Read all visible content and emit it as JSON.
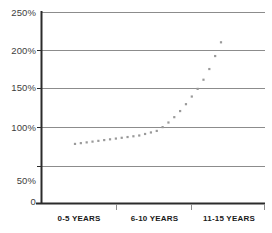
{
  "chart_data": {
    "type": "line",
    "title": "",
    "subtitle": "",
    "xlabel": "",
    "ylabel": "",
    "ylim": [
      0,
      250
    ],
    "ytick_labels": [
      "250%",
      "200%",
      "150%",
      "100%",
      "50%",
      "0"
    ],
    "ytick_values": [
      250,
      200,
      150,
      100,
      50,
      0
    ],
    "categories": [
      "0-5 YEARS",
      "6-10 YEARS",
      "11-15 YEARS"
    ],
    "grid": "horizontal",
    "legend": "none",
    "marker": "dotted-square",
    "series_color": "#9a9a9a",
    "axis_color": "#000000",
    "grid_color": "#808080",
    "series": [
      {
        "name": "",
        "x": [
          1,
          2,
          3,
          4,
          5,
          6,
          7,
          8,
          9,
          10,
          11,
          12,
          13,
          14,
          15,
          16,
          17,
          18,
          19,
          20,
          21,
          22,
          23,
          24,
          25,
          26
        ],
        "values": [
          78,
          79,
          80,
          81,
          82,
          83,
          84,
          85,
          86,
          87,
          88,
          89,
          91,
          93,
          95,
          100,
          106,
          113,
          121,
          130,
          140,
          150,
          162,
          176,
          193,
          211
        ]
      }
    ],
    "annotations": []
  },
  "axis": {
    "y_labels": [
      {
        "text": "250%",
        "value": 250
      },
      {
        "text": "200%",
        "value": 200
      },
      {
        "text": "150%",
        "value": 150
      },
      {
        "text": "100%",
        "value": 100
      },
      {
        "text": "50%",
        "value": 50
      },
      {
        "text": "0",
        "value": 0
      }
    ],
    "x_labels": [
      {
        "text": "0-5 YEARS"
      },
      {
        "text": "6-10 YEARS"
      },
      {
        "text": "11-15 YEARS"
      }
    ]
  }
}
